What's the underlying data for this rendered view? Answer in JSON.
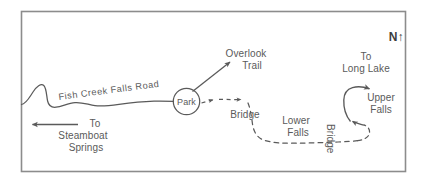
{
  "map": {
    "title": "Fish Creek Falls Area Trail Map",
    "frame": {
      "x": 21,
      "y": 11,
      "width": 385,
      "height": 161,
      "border_color": "#808080"
    },
    "background_color": "#ffffff",
    "line_color": "#5a5a5a",
    "text_color": "#5a5a5a",
    "compass": {
      "letter": "N",
      "arrow_glyph": "↑"
    },
    "features": {
      "road": {
        "name": "Fish Creek Falls Road",
        "label": "Fish Creek Falls Road",
        "style": "solid"
      },
      "park": {
        "label": "Park",
        "shape": "circle"
      },
      "overlook_trail": {
        "line1": "Overlook",
        "line2": "Trail",
        "style": "solid-arrow"
      },
      "steamboat": {
        "line1": "To",
        "line2": "Steamboat",
        "line3": "Springs",
        "style": "solid-arrow-left"
      },
      "bridge_west": {
        "label": "Bridge"
      },
      "lower_falls": {
        "line1": "Lower",
        "line2": "Falls"
      },
      "bridge_east": {
        "label": "Bridge",
        "orientation": "vertical"
      },
      "upper_falls": {
        "line1": "Upper",
        "line2": "Falls"
      },
      "long_lake": {
        "line1": "To",
        "line2": "Long Lake",
        "style": "solid-arrow"
      },
      "trail": {
        "style": "dashed"
      }
    }
  }
}
